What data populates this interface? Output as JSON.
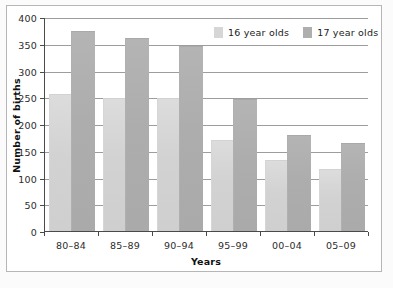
{
  "chart_data": {
    "type": "bar",
    "title": "",
    "xlabel": "Years",
    "ylabel": "Number of births",
    "categories": [
      "80–84",
      "85–89",
      "90–94",
      "95–99",
      "00–04",
      "05–09"
    ],
    "series": [
      {
        "name": "16 year olds",
        "color": "#d4d4d4",
        "values": [
          256,
          249,
          249,
          170,
          132,
          116
        ]
      },
      {
        "name": "17 year olds",
        "color": "#ababab",
        "values": [
          374,
          360,
          345,
          247,
          179,
          164
        ]
      }
    ],
    "ylim": [
      0,
      400
    ],
    "yticks": [
      0,
      50,
      100,
      150,
      200,
      250,
      300,
      350,
      400
    ],
    "ytick_labels": [
      "0",
      "50",
      "100",
      "150",
      "200",
      "250",
      "300",
      "350",
      "400"
    ],
    "grid": true,
    "legend_position": "top-right"
  },
  "legend": {
    "entries": [
      {
        "label": "16 year olds"
      },
      {
        "label": "17 year olds"
      }
    ]
  },
  "axes": {
    "x_title": "Years",
    "y_title": "Number of births"
  }
}
